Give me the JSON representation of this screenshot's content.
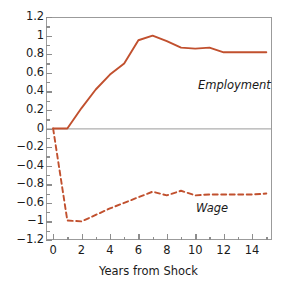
{
  "chart_data": {
    "type": "line",
    "title": "",
    "subtitle": "",
    "xlabel": "Years from Shock",
    "ylabel": "",
    "xlim": [
      -0.5,
      15.4
    ],
    "ylim": [
      -1.2,
      1.2
    ],
    "grid": false,
    "legend_position": "inline-annotation",
    "x_ticks": [
      0,
      2,
      4,
      6,
      8,
      10,
      12,
      14
    ],
    "x_tick_labels": [
      "0",
      "2",
      "4",
      "6",
      "8",
      "10",
      "12",
      "14"
    ],
    "x_minor_ticks": [
      1,
      3,
      5,
      7,
      9,
      11,
      13,
      15
    ],
    "y_ticks": [
      1.2,
      1.0,
      0.8,
      0.6,
      0.4,
      0.2,
      0,
      -0.2,
      -0.4,
      -0.6,
      -0.8,
      -1.0,
      -1.2
    ],
    "y_tick_labels": [
      "1.2",
      "1",
      "0.8",
      "0.6",
      "0.4",
      "0.2",
      "0",
      "−0.2",
      "−0.4",
      "−0.8",
      "−0.6",
      "−1",
      "−1.2"
    ],
    "y_minor_ticks": [
      1.1,
      0.9,
      0.7,
      0.5,
      0.3,
      0.1,
      -0.1,
      -0.3,
      -0.5,
      -0.7,
      -0.9,
      -1.1
    ],
    "zero_line": 0,
    "series": [
      {
        "name": "Employment",
        "style": "solid",
        "color": "#C1502E",
        "x": [
          0,
          1,
          2,
          3,
          4,
          5,
          6,
          7,
          8,
          9,
          10,
          11,
          12,
          13,
          14,
          15
        ],
        "values": [
          0,
          0,
          0.22,
          0.42,
          0.58,
          0.7,
          0.95,
          1.0,
          0.94,
          0.87,
          0.86,
          0.87,
          0.82,
          0.82,
          0.82,
          0.82
        ]
      },
      {
        "name": "Wage",
        "style": "dashed",
        "color": "#C1502E",
        "x": [
          0,
          1,
          2,
          3,
          4,
          5,
          6,
          7,
          8,
          9,
          10,
          11,
          12,
          13,
          14,
          15
        ],
        "values": [
          0,
          -0.99,
          -1.0,
          -0.93,
          -0.86,
          -0.8,
          -0.74,
          -0.68,
          -0.72,
          -0.67,
          -0.72,
          -0.71,
          -0.71,
          -0.71,
          -0.71,
          -0.7
        ]
      }
    ],
    "annotations": [
      {
        "text": "Employment",
        "series": "Employment"
      },
      {
        "text": "Wage",
        "series": "Wage"
      }
    ],
    "colors": {
      "series_line": "#C1502E",
      "axis_frame": "#9b9b9b",
      "tick": "#8d8d8d",
      "text": "#1a1a1a",
      "background": "#ffffff"
    }
  }
}
